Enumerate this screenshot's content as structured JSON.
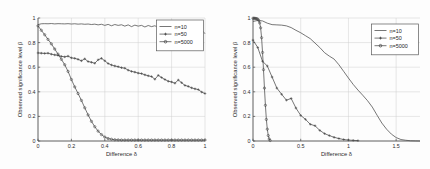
{
  "figure": {
    "background_color": "#fdfdfd",
    "line_color": "#3c3c3c",
    "axis_color": "#4a4a4a",
    "grid_color": "#cfcfcf"
  },
  "chart_data": [
    {
      "type": "line",
      "panel": "left",
      "title": "",
      "xlabel": "Difference δ",
      "ylabel": "Observed significance level β",
      "xlim": [
        0,
        1
      ],
      "ylim": [
        0,
        1
      ],
      "xticks": [
        0,
        0.2,
        0.4,
        0.6,
        0.8,
        1
      ],
      "xticklabels": [
        "0",
        "0.2",
        "0.4",
        "0.6",
        "0.8",
        "1"
      ],
      "yticks": [
        0,
        0.2,
        0.4,
        0.6,
        0.8,
        1
      ],
      "yticklabels": [
        "0",
        "0.2",
        "0.4",
        "0.6",
        "0.8",
        "1"
      ],
      "grid": true,
      "legend_position": "upper right",
      "series": [
        {
          "name": "n=10",
          "marker": "none",
          "x": [
            0,
            0.02,
            0.04,
            0.06,
            0.08,
            0.1,
            0.12,
            0.14,
            0.16,
            0.18,
            0.2,
            0.22,
            0.24,
            0.26,
            0.28,
            0.3,
            0.32,
            0.34,
            0.36,
            0.38,
            0.4,
            0.42,
            0.44,
            0.46,
            0.48,
            0.5,
            0.52,
            0.54,
            0.56,
            0.58,
            0.6,
            0.62,
            0.64,
            0.66,
            0.68,
            0.7,
            0.72,
            0.74,
            0.76,
            0.78,
            0.8,
            0.82,
            0.84,
            0.86,
            0.88,
            0.9,
            0.92,
            0.94,
            0.96,
            0.98,
            1.0
          ],
          "y": [
            0.946,
            0.953,
            0.954,
            0.953,
            0.955,
            0.952,
            0.954,
            0.953,
            0.952,
            0.954,
            0.951,
            0.953,
            0.95,
            0.952,
            0.949,
            0.951,
            0.947,
            0.95,
            0.944,
            0.949,
            0.94,
            0.948,
            0.937,
            0.947,
            0.94,
            0.945,
            0.934,
            0.944,
            0.93,
            0.942,
            0.934,
            0.94,
            0.927,
            0.939,
            0.93,
            0.937,
            0.922,
            0.935,
            0.928,
            0.932,
            0.914,
            0.928,
            0.918,
            0.925,
            0.906,
            0.92,
            0.908,
            0.916,
            0.896,
            0.905,
            0.872
          ]
        },
        {
          "name": "n=50",
          "marker": "plus",
          "x": [
            0,
            0.02,
            0.04,
            0.06,
            0.08,
            0.1,
            0.12,
            0.14,
            0.16,
            0.18,
            0.2,
            0.22,
            0.24,
            0.26,
            0.28,
            0.3,
            0.32,
            0.34,
            0.36,
            0.38,
            0.4,
            0.42,
            0.44,
            0.46,
            0.48,
            0.5,
            0.52,
            0.54,
            0.56,
            0.58,
            0.6,
            0.62,
            0.64,
            0.66,
            0.68,
            0.7,
            0.72,
            0.74,
            0.76,
            0.78,
            0.8,
            0.82,
            0.84,
            0.86,
            0.88,
            0.9,
            0.92,
            0.94,
            0.96,
            0.98,
            1.0
          ],
          "y": [
            0.716,
            0.714,
            0.712,
            0.714,
            0.706,
            0.7,
            0.696,
            0.688,
            0.684,
            0.69,
            0.676,
            0.672,
            0.664,
            0.652,
            0.668,
            0.646,
            0.64,
            0.632,
            0.66,
            0.672,
            0.652,
            0.63,
            0.618,
            0.61,
            0.604,
            0.596,
            0.592,
            0.576,
            0.566,
            0.56,
            0.552,
            0.548,
            0.538,
            0.53,
            0.524,
            0.502,
            0.534,
            0.516,
            0.5,
            0.486,
            0.48,
            0.47,
            0.496,
            0.474,
            0.452,
            0.444,
            0.432,
            0.424,
            0.418,
            0.398,
            0.386
          ]
        },
        {
          "name": "n=5000",
          "marker": "circle",
          "x": [
            0,
            0.02,
            0.04,
            0.06,
            0.08,
            0.1,
            0.12,
            0.14,
            0.16,
            0.18,
            0.2,
            0.22,
            0.24,
            0.26,
            0.28,
            0.3,
            0.32,
            0.34,
            0.36,
            0.38,
            0.4,
            0.42,
            0.44,
            0.46,
            0.48,
            0.5,
            0.52,
            0.54,
            0.56,
            0.58,
            0.6,
            0.62,
            0.64,
            0.66,
            0.68,
            0.7,
            0.72,
            0.74,
            0.76,
            0.78,
            0.8,
            0.82,
            0.84,
            0.86,
            0.88,
            0.9,
            0.92,
            0.94,
            0.96,
            0.98,
            1.0
          ],
          "y": [
            0.936,
            0.9,
            0.864,
            0.826,
            0.79,
            0.748,
            0.706,
            0.664,
            0.62,
            0.566,
            0.5,
            0.44,
            0.386,
            0.33,
            0.27,
            0.212,
            0.16,
            0.116,
            0.08,
            0.052,
            0.032,
            0.02,
            0.014,
            0.01,
            0.009,
            0.008,
            0.008,
            0.008,
            0.008,
            0.008,
            0.008,
            0.008,
            0.008,
            0.008,
            0.008,
            0.008,
            0.008,
            0.008,
            0.008,
            0.008,
            0.008,
            0.008,
            0.008,
            0.008,
            0.008,
            0.008,
            0.008,
            0.008,
            0.008,
            0.008,
            0.008
          ]
        }
      ]
    },
    {
      "type": "line",
      "panel": "right",
      "title": "",
      "xlabel": "Difference δ",
      "ylabel": "Observed significance level β",
      "xlim": [
        0,
        1.75
      ],
      "ylim": [
        0,
        1
      ],
      "xticks": [
        0,
        0.5,
        1,
        1.5
      ],
      "xticklabels": [
        "0",
        "0.5",
        "1",
        "1.5"
      ],
      "yticks": [
        0,
        0.2,
        0.4,
        0.6,
        0.8,
        1
      ],
      "yticklabels": [
        "0",
        "0.2",
        "0.4",
        "0.6",
        "0.8",
        "1"
      ],
      "grid": true,
      "legend_position": "upper right",
      "series": [
        {
          "name": "n=10",
          "marker": "none",
          "x": [
            0,
            0.05,
            0.1,
            0.15,
            0.2,
            0.25,
            0.3,
            0.35,
            0.4,
            0.45,
            0.5,
            0.55,
            0.6,
            0.65,
            0.7,
            0.75,
            0.8,
            0.85,
            0.9,
            0.95,
            1.0,
            1.05,
            1.1,
            1.15,
            1.2,
            1.25,
            1.3,
            1.35,
            1.4,
            1.45,
            1.5,
            1.55,
            1.6,
            1.65,
            1.7,
            1.75
          ],
          "y": [
            0.972,
            0.98,
            0.976,
            0.958,
            0.946,
            0.944,
            0.942,
            0.936,
            0.922,
            0.9,
            0.88,
            0.856,
            0.832,
            0.796,
            0.76,
            0.718,
            0.69,
            0.666,
            0.62,
            0.566,
            0.512,
            0.46,
            0.414,
            0.372,
            0.328,
            0.276,
            0.21,
            0.146,
            0.096,
            0.056,
            0.028,
            0.012,
            0.006,
            0.002,
            0.001,
            0.0
          ]
        },
        {
          "name": "n=50",
          "marker": "plus",
          "x": [
            0,
            0.05,
            0.1,
            0.15,
            0.2,
            0.25,
            0.3,
            0.35,
            0.4,
            0.45,
            0.5,
            0.55,
            0.6,
            0.65,
            0.7,
            0.75,
            0.8,
            0.85,
            0.9,
            0.95,
            1.0,
            1.05,
            1.1
          ],
          "y": [
            0.82,
            0.76,
            0.648,
            0.61,
            0.52,
            0.43,
            0.38,
            0.332,
            0.346,
            0.268,
            0.208,
            0.176,
            0.136,
            0.124,
            0.086,
            0.06,
            0.044,
            0.03,
            0.02,
            0.012,
            0.008,
            0.005,
            0.003
          ]
        },
        {
          "name": "n=5000",
          "marker": "circle",
          "x": [
            0,
            0.01,
            0.02,
            0.03,
            0.04,
            0.05,
            0.06,
            0.07,
            0.08,
            0.09,
            0.1,
            0.11,
            0.12,
            0.13,
            0.14,
            0.15,
            0.16,
            0.17,
            0.18
          ],
          "y": [
            0.998,
            0.998,
            0.997,
            0.996,
            0.994,
            0.99,
            0.98,
            0.96,
            0.92,
            0.84,
            0.72,
            0.58,
            0.43,
            0.29,
            0.175,
            0.096,
            0.044,
            0.016,
            0.004
          ]
        }
      ]
    }
  ]
}
